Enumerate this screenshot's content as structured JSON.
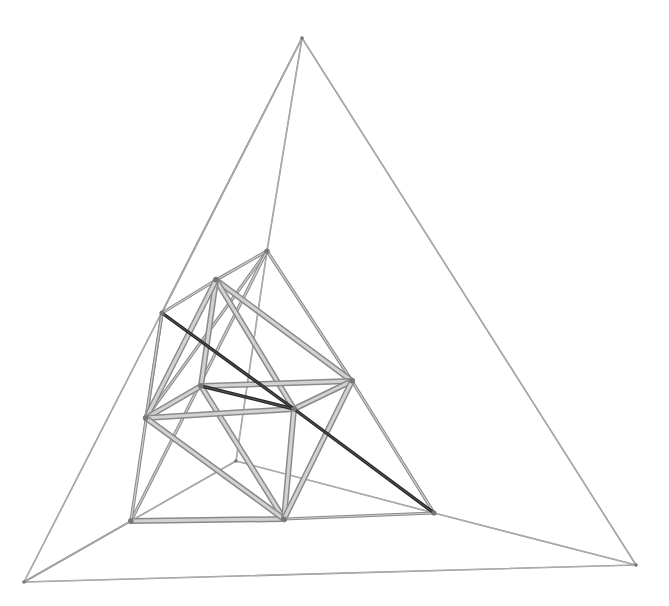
{
  "diagram": {
    "title": "",
    "colors": {
      "background": "#ffffff",
      "thin_edge": "#8c8c8c",
      "rod_edge": "#b0b0b0",
      "highlight_edge": "#2a2a2a",
      "node": "#777777"
    },
    "vertices": [
      {
        "id": "A",
        "label": ""
      },
      {
        "id": "B",
        "label": ""
      },
      {
        "id": "C",
        "label": ""
      },
      {
        "id": "D",
        "label": ""
      },
      {
        "id": "E",
        "label": ""
      },
      {
        "id": "F",
        "label": ""
      },
      {
        "id": "G",
        "label": ""
      },
      {
        "id": "H",
        "label": ""
      },
      {
        "id": "I",
        "label": ""
      },
      {
        "id": "J",
        "label": ""
      },
      {
        "id": "K",
        "label": ""
      },
      {
        "id": "L",
        "label": ""
      },
      {
        "id": "M",
        "label": ""
      },
      {
        "id": "N",
        "label": ""
      }
    ],
    "edges": [
      {
        "from": "A",
        "to": "B",
        "style": "thin"
      },
      {
        "from": "A",
        "to": "C",
        "style": "thin"
      },
      {
        "from": "B",
        "to": "C",
        "style": "thin"
      },
      {
        "from": "A",
        "to": "D",
        "style": "thin"
      },
      {
        "from": "B",
        "to": "L",
        "style": "thin"
      },
      {
        "from": "B",
        "to": "K",
        "style": "thin"
      },
      {
        "from": "C",
        "to": "N",
        "style": "thin"
      },
      {
        "from": "K",
        "to": "N",
        "style": "thin"
      },
      {
        "from": "K",
        "to": "D",
        "style": "thin"
      },
      {
        "from": "F",
        "to": "A",
        "style": "thin"
      },
      {
        "from": "D",
        "to": "E",
        "style": "mid"
      },
      {
        "from": "D",
        "to": "G",
        "style": "mid"
      },
      {
        "from": "D",
        "to": "J",
        "style": "mid"
      },
      {
        "from": "D",
        "to": "L",
        "style": "mid"
      },
      {
        "from": "E",
        "to": "F",
        "style": "mid"
      },
      {
        "from": "F",
        "to": "L",
        "style": "mid"
      },
      {
        "from": "G",
        "to": "N",
        "style": "mid"
      },
      {
        "from": "N",
        "to": "M",
        "style": "mid"
      },
      {
        "from": "L",
        "to": "M",
        "style": "rod"
      },
      {
        "from": "E",
        "to": "G",
        "style": "rod"
      },
      {
        "from": "E",
        "to": "I",
        "style": "rod"
      },
      {
        "from": "E",
        "to": "H",
        "style": "rod"
      },
      {
        "from": "E",
        "to": "J",
        "style": "rod"
      },
      {
        "from": "F",
        "to": "J",
        "style": "mid"
      },
      {
        "from": "H",
        "to": "G",
        "style": "rod"
      },
      {
        "from": "H",
        "to": "J",
        "style": "rod"
      },
      {
        "from": "H",
        "to": "M",
        "style": "rod"
      },
      {
        "from": "J",
        "to": "I",
        "style": "rod"
      },
      {
        "from": "J",
        "to": "M",
        "style": "rod"
      },
      {
        "from": "I",
        "to": "G",
        "style": "rod"
      },
      {
        "from": "I",
        "to": "M",
        "style": "rod"
      },
      {
        "from": "G",
        "to": "M",
        "style": "rod"
      },
      {
        "from": "F",
        "to": "I",
        "style": "dark"
      },
      {
        "from": "H",
        "to": "I",
        "style": "dark"
      },
      {
        "from": "I",
        "to": "N",
        "style": "dark"
      }
    ]
  }
}
